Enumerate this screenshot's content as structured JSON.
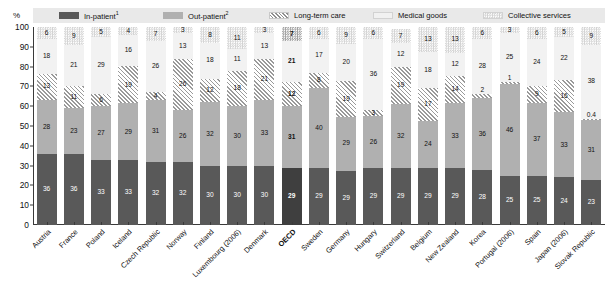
{
  "axis": {
    "percent_symbol": "%",
    "yticks": [
      0,
      10,
      20,
      30,
      40,
      50,
      60,
      70,
      80,
      90,
      100
    ]
  },
  "legend": {
    "items": [
      {
        "label": "In-patient",
        "sup": "1",
        "icon": "inpatient-swatch",
        "color": "#595959"
      },
      {
        "label": "Out-patient",
        "sup": "2",
        "icon": "outpatient-swatch",
        "color": "#b0b0b0"
      },
      {
        "label": "Long-term care",
        "sup": "",
        "icon": "longterm-swatch",
        "color": "#9a9a9a"
      },
      {
        "label": "Medical goods",
        "sup": "",
        "icon": "medical-swatch",
        "color": "#f2f2f2"
      },
      {
        "label": "Collective services",
        "sup": "",
        "icon": "collective-swatch",
        "color": "#d2d2d2"
      }
    ]
  },
  "chart_data": {
    "type": "bar",
    "title": "",
    "xlabel": "",
    "ylabel": "%",
    "ylim": [
      0,
      100
    ],
    "yticks": [
      0,
      10,
      20,
      30,
      40,
      50,
      60,
      70,
      80,
      90,
      100
    ],
    "grid": false,
    "stacked": true,
    "legend_position": "top",
    "highlight_category": "OECD",
    "categories": [
      "Austria",
      "France",
      "Poland",
      "Iceland",
      "Czech Republic",
      "Norway",
      "Finland",
      "Luxembourg (2006)",
      "Denmark",
      "OECD",
      "Sweden",
      "Germany",
      "Hungary",
      "Switzerland",
      "Belgium",
      "New Zealand",
      "Korea",
      "Portugal (2006)",
      "Spain",
      "Japan (2006)",
      "Slovak Republic"
    ],
    "series": [
      {
        "name": "In-patient",
        "values": [
          36,
          36,
          33,
          33,
          32,
          32,
          30,
          30,
          30,
          29,
          29,
          29,
          29,
          29,
          29,
          29,
          28,
          25,
          25,
          24,
          23
        ]
      },
      {
        "name": "Out-patient",
        "values": [
          28,
          23,
          27,
          29,
          31,
          26,
          32,
          30,
          33,
          31,
          40,
          29,
          26,
          32,
          24,
          33,
          36,
          46,
          37,
          33,
          31
        ]
      },
      {
        "name": "Long-term care",
        "values": [
          13,
          11,
          6,
          19,
          4,
          26,
          12,
          18,
          21,
          12,
          8,
          19,
          3,
          19,
          17,
          14,
          2,
          1,
          9,
          16,
          0.4
        ]
      },
      {
        "name": "Medical goods",
        "values": [
          18,
          21,
          29,
          16,
          26,
          13,
          18,
          11,
          13,
          21,
          17,
          20,
          36,
          12,
          18,
          12,
          28,
          25,
          24,
          22,
          38
        ]
      },
      {
        "name": "Collective services",
        "values": [
          6,
          9,
          5,
          4,
          7,
          3,
          8,
          11,
          3,
          7,
          6,
          9,
          6,
          7,
          13,
          13,
          6,
          3,
          6,
          5,
          9
        ]
      }
    ]
  }
}
